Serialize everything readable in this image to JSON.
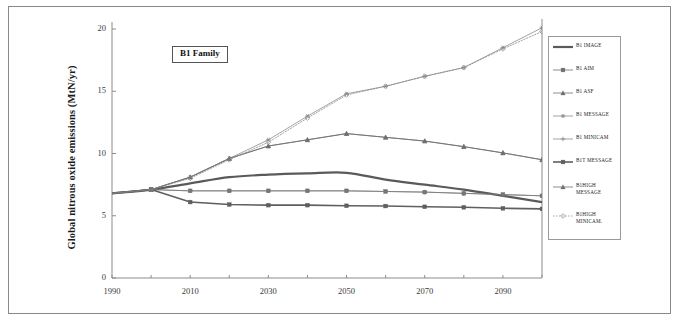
{
  "figure": {
    "annotation_label": "B1 Family",
    "y_axis_title": "Global nitrous oxide emissions (MtN/yr)"
  },
  "axis": {
    "y_ticks": [
      "0",
      "5",
      "10",
      "15",
      "20"
    ],
    "x_ticks": [
      "1990",
      "2010",
      "2030",
      "2050",
      "2070",
      "2090"
    ]
  },
  "legend": {
    "items": [
      {
        "label": "B1 IMAGE",
        "marker": "none",
        "dash": "solid",
        "width": 2.2,
        "color": "#5a5a5a"
      },
      {
        "label": "B1 AIM",
        "marker": "square",
        "dash": "solid",
        "width": 0.8,
        "color": "#6f6f6f"
      },
      {
        "label": "B1 ASF",
        "marker": "triangle",
        "dash": "solid",
        "width": 0.8,
        "color": "#6f6f6f"
      },
      {
        "label": "B1 MESSAGE",
        "marker": "star",
        "dash": "solid",
        "width": 0.7,
        "color": "#7d7d7d"
      },
      {
        "label": "B1 MINICAM",
        "marker": "plus",
        "dash": "solid",
        "width": 0.7,
        "color": "#7d7d7d"
      },
      {
        "label": "B1T MESSAGE",
        "marker": "square",
        "dash": "solid",
        "width": 1.6,
        "color": "#5f5f5f"
      },
      {
        "label": "B1HIGH\nMESSAGE",
        "marker": "triangle",
        "dash": "solid",
        "width": 0.8,
        "color": "#6f6f6f"
      },
      {
        "label": "B1HIGH\nMINICAM.",
        "marker": "diamond",
        "dash": "dotted",
        "width": 0.8,
        "color": "#8a8a8a"
      }
    ]
  },
  "chart_data": {
    "type": "line",
    "title": "",
    "xlabel": "",
    "ylabel": "Global nitrous oxide emissions (MtN/yr)",
    "annotation": "B1 Family",
    "xlim": [
      1990,
      2100
    ],
    "ylim": [
      0,
      20
    ],
    "grid": false,
    "legend_position": "right",
    "x": [
      1990,
      2000,
      2010,
      2020,
      2030,
      2040,
      2050,
      2060,
      2070,
      2080,
      2090,
      2100
    ],
    "series": [
      {
        "name": "B1 IMAGE",
        "marker": "none",
        "dash": "solid",
        "values": [
          6.8,
          7.1,
          7.6,
          8.1,
          8.3,
          8.4,
          8.45,
          7.9,
          7.5,
          7.1,
          6.6,
          6.1
        ]
      },
      {
        "name": "B1 AIM",
        "marker": "square",
        "dash": "solid",
        "values": [
          6.8,
          7.1,
          7.0,
          7.0,
          7.0,
          7.0,
          7.0,
          6.95,
          6.9,
          6.8,
          6.7,
          6.6
        ]
      },
      {
        "name": "B1 ASF",
        "marker": "triangle",
        "dash": "solid",
        "values": [
          6.8,
          7.1,
          8.1,
          9.6,
          10.6,
          11.1,
          11.6,
          11.3,
          11.0,
          10.55,
          10.05,
          9.5
        ]
      },
      {
        "name": "B1 MESSAGE",
        "marker": "star",
        "dash": "solid",
        "values": [
          6.8,
          7.1,
          8.1,
          9.6,
          11.1,
          13.0,
          14.8,
          15.4,
          16.2,
          16.9,
          18.5,
          20.1
        ]
      },
      {
        "name": "B1 MINICAM",
        "marker": "plus",
        "dash": "solid",
        "values": [
          6.8,
          7.1,
          7.0,
          7.0,
          7.0,
          7.0,
          7.0,
          6.95,
          6.9,
          6.8,
          6.7,
          6.6
        ]
      },
      {
        "name": "B1T MESSAGE",
        "marker": "square",
        "dash": "solid",
        "values": [
          6.8,
          7.1,
          6.1,
          5.9,
          5.85,
          5.85,
          5.8,
          5.78,
          5.72,
          5.68,
          5.6,
          5.55
        ]
      },
      {
        "name": "B1HIGH MESSAGE",
        "marker": "triangle",
        "dash": "solid",
        "values": [
          6.8,
          7.1,
          8.1,
          9.6,
          10.6,
          11.1,
          11.6,
          11.3,
          11.0,
          10.55,
          10.05,
          9.5
        ]
      },
      {
        "name": "B1HIGH MINICAM.",
        "marker": "diamond",
        "dash": "dotted",
        "values": [
          6.8,
          7.1,
          8.0,
          9.5,
          10.9,
          12.85,
          14.7,
          15.4,
          16.2,
          16.9,
          18.4,
          19.8
        ]
      }
    ]
  }
}
